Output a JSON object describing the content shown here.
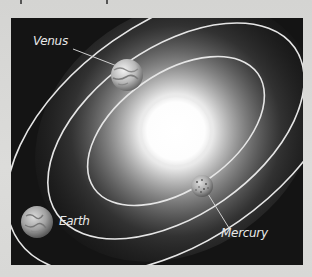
{
  "figure": {
    "background_color": "#141414",
    "orbit_color": "#e6e6e6",
    "sun": {
      "name": "Sun",
      "cx": 165,
      "cy": 113,
      "r": 34,
      "color": "#ffffff"
    },
    "orbits": [
      {
        "planet": "Mercury",
        "rx": 100,
        "ry": 58,
        "rotation": -35
      },
      {
        "planet": "Venus",
        "rx": 145,
        "ry": 84,
        "rotation": -35
      },
      {
        "planet": "Earth",
        "rx": 192,
        "ry": 110,
        "rotation": -35
      }
    ],
    "planets": [
      {
        "name": "Venus",
        "label": "Venus",
        "cx": 116,
        "cy": 57,
        "r": 16
      },
      {
        "name": "Earth",
        "label": "Earth",
        "cx": 26,
        "cy": 204,
        "r": 16
      },
      {
        "name": "Mercury",
        "label": "Mercury",
        "cx": 191,
        "cy": 168,
        "r": 11
      }
    ],
    "labels": {
      "venus": "Venus",
      "earth": "Earth",
      "mercury": "Mercury"
    }
  }
}
